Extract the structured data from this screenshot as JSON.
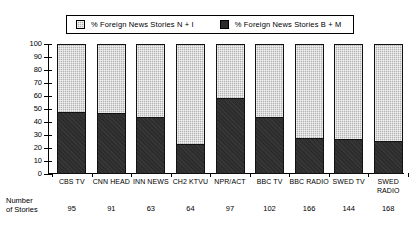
{
  "legend": {
    "entries": [
      {
        "label": "% Foreign News Stories N + I",
        "swatch": "light-checker-swatch",
        "color": "#b0b0b0"
      },
      {
        "label": "% Foreign News Stories B + M",
        "swatch": "dark-solid-swatch",
        "color": "#2b2b2b"
      }
    ]
  },
  "footer": {
    "row_title": "Number\nof Stories"
  },
  "chart_data": {
    "type": "bar",
    "title": "",
    "subtype": "stacked-percent",
    "xlabel": "",
    "ylabel": "",
    "ylim": [
      0,
      100
    ],
    "ytick_values": [
      0,
      10,
      20,
      30,
      40,
      50,
      60,
      70,
      80,
      90,
      100
    ],
    "ytick_labels": [
      "0",
      "10",
      "20",
      "30",
      "40",
      "50",
      "60",
      "70",
      "80",
      "90",
      "100"
    ],
    "grid": false,
    "legend_position": "top-center",
    "categories": [
      "CBS TV",
      "CNN HEAD",
      "INN NEWS",
      "CH2 KTVU",
      "NPR/ACT",
      "BBC TV",
      "BBC RADIO",
      "SWED TV",
      "SWED\nRADIO"
    ],
    "series": [
      {
        "name": "% Foreign News Stories B + M",
        "values": [
          47,
          46,
          43,
          22,
          58,
          43,
          27,
          26,
          25
        ]
      },
      {
        "name": "% Foreign News Stories N + I",
        "values": [
          53,
          54,
          57,
          78,
          42,
          57,
          73,
          74,
          75
        ]
      }
    ],
    "number_of_stories": [
      95,
      91,
      63,
      64,
      97,
      102,
      166,
      144,
      168
    ]
  }
}
